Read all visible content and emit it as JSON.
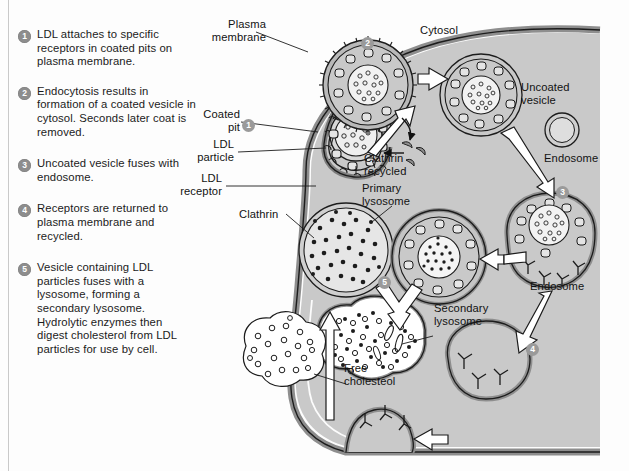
{
  "figure": {
    "cytosol_color": "#c9c9c9",
    "membrane_color": "#9b9b9b",
    "badge_color": "#8d8d8d"
  },
  "legend": {
    "items": [
      {
        "number": "1",
        "text": "LDL attaches to specific receptors in coated pits on plasma membrane."
      },
      {
        "number": "2",
        "text": "Endocytosis results in formation of a coated vesicle in cytosol. Seconds later coat is removed."
      },
      {
        "number": "3",
        "text": "Uncoated vesicle fuses with endosome."
      },
      {
        "number": "4",
        "text": "Receptors are returned to plasma membrane and recycled."
      },
      {
        "number": "5",
        "text": "Vesicle containing LDL particles fuses with a lysosome, forming a secondary lysosome. Hydrolytic enzymes then digest cholesterol from LDL particles for use by cell."
      }
    ]
  },
  "diagram": {
    "labels": {
      "plasma_membrane": "Plasma\nmembrane",
      "cytosol": "Cytosol",
      "coated_pit": "Coated\npit",
      "ldl_particle": "LDL\nparticle",
      "ldl_receptor": "LDL\nreceptor",
      "clathrin": "Clathrin",
      "clathrin_recycled": "Clathrin\nrecycled",
      "uncoated_vesicle": "Uncoated\nvesicle",
      "endosome_small": "Endosome",
      "endosome_large": "Endosome",
      "primary_lysosome": "Primary\nlysosome",
      "secondary_lysosome": "Secondary\nlysosome",
      "free_cholesterol": "Free\ncholesteol"
    },
    "step_markers": [
      {
        "number": "1"
      },
      {
        "number": "2"
      },
      {
        "number": "3"
      },
      {
        "number": "4"
      },
      {
        "number": "5"
      }
    ]
  }
}
